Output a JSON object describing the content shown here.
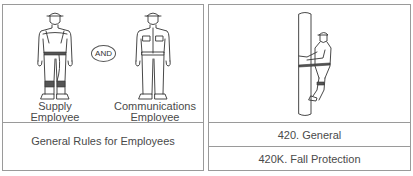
{
  "left_panel": {
    "figures": [
      {
        "name": "supply-employee",
        "label_line1": "Supply",
        "label_line2": "Employee"
      },
      {
        "name": "communications-employee",
        "label_line1": "Communications",
        "label_line2": "Employee"
      }
    ],
    "connector": "AND",
    "caption": "General Rules for Employees"
  },
  "right_panel": {
    "figure": "worker-climbing-pole",
    "rows": [
      {
        "label": "420. General"
      },
      {
        "label": "420K. Fall Protection"
      }
    ]
  },
  "colors": {
    "border": "#9a9a9a",
    "line_art": "#333333",
    "text": "#4a4a4a"
  }
}
